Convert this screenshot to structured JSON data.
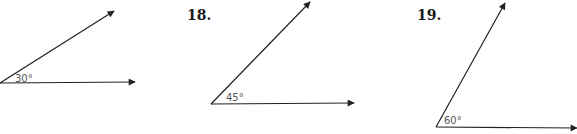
{
  "colors": {
    "line": "#222222",
    "label": "#555555",
    "number": "#1a1a1a",
    "background": "#ffffff"
  },
  "figures": [
    {
      "number": "",
      "angle_label": "30°",
      "angle_degrees": 30,
      "vertex": [
        0,
        83
      ],
      "ray_upper_end": [
        114,
        11
      ],
      "ray_lower_end": [
        135,
        82
      ],
      "label_pos": [
        15,
        82
      ]
    },
    {
      "number": "18.",
      "number_pos": [
        187,
        20
      ],
      "angle_label": "45°",
      "angle_degrees": 45,
      "vertex": [
        211,
        104
      ],
      "ray_upper_end": [
        310,
        2
      ],
      "ray_lower_end": [
        354,
        103
      ],
      "label_pos": [
        226,
        101
      ]
    },
    {
      "number": "19.",
      "number_pos": [
        417,
        20
      ],
      "angle_label": "60°",
      "angle_degrees": 60,
      "vertex": [
        436,
        127
      ],
      "ray_upper_end": [
        505,
        3
      ],
      "ray_lower_end": [
        577,
        128
      ],
      "label_pos": [
        444,
        124
      ]
    }
  ]
}
